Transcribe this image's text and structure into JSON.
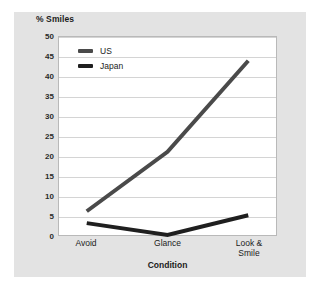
{
  "chart_data": {
    "type": "line",
    "title": "% Smiles",
    "xlabel": "Condition",
    "ylabel": "% Smiles",
    "categories": [
      "Avoid",
      "Glance",
      "Look &\nSmile"
    ],
    "series": [
      {
        "name": "US",
        "values": [
          6,
          21,
          44
        ],
        "color": "#4a4a4a"
      },
      {
        "name": "Japan",
        "values": [
          3,
          0,
          5
        ],
        "color": "#1f1f1f"
      }
    ],
    "ylim": [
      0,
      50
    ],
    "ytick_step": 5,
    "yticks": [
      "50",
      "45",
      "40",
      "35",
      "30",
      "25",
      "20",
      "15",
      "10",
      "5",
      "0"
    ],
    "grid": true,
    "legend_position": "top-left"
  },
  "legend": {
    "entries": [
      {
        "label": "US",
        "color": "#4a4a4a"
      },
      {
        "label": "Japan",
        "color": "#1f1f1f"
      }
    ]
  },
  "axes": {
    "x_categories": [
      {
        "line1": "Avoid",
        "line2": ""
      },
      {
        "line1": "Glance",
        "line2": ""
      },
      {
        "line1": "Look &",
        "line2": "Smile"
      }
    ],
    "x_title": "Condition",
    "y_title": "% Smiles"
  },
  "colors": {
    "card_background": "#e3e3e3",
    "plot_background": "#ffffff",
    "gridline": "#d4d4d4",
    "axis_border": "#b9b9b9",
    "series_us": "#4a4a4a",
    "series_japan": "#1f1f1f",
    "text": "#1b1b1b"
  }
}
